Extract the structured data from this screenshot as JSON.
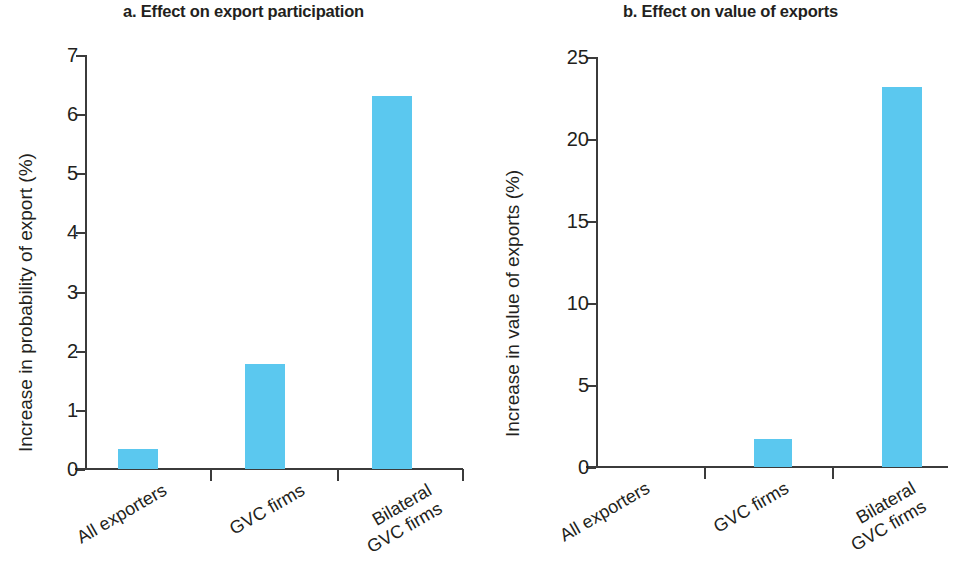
{
  "chart_data": [
    {
      "type": "bar",
      "title": "a. Effect on export participation",
      "xlabel": "",
      "ylabel": "Increase in probability of export (%)",
      "categories": [
        "All exporters",
        "GVC firms",
        "Bilateral\nGVC firms"
      ],
      "values": [
        0.33,
        1.77,
        6.31
      ],
      "ylim": [
        0,
        7
      ],
      "yticks": [
        0,
        1,
        2,
        3,
        4,
        5,
        6,
        7
      ],
      "ytick_labels": [
        "0",
        "1",
        "2",
        "3",
        "4",
        "5",
        "6",
        "7"
      ],
      "grid": false,
      "legend": "none",
      "bar_color": "#5bc8ef"
    },
    {
      "type": "bar",
      "title": "b. Effect on value of exports",
      "xlabel": "",
      "ylabel": "Increase in value of exports (%)",
      "categories": [
        "All exporters",
        "GVC firms",
        "Bilateral\nGVC firms"
      ],
      "values": [
        0,
        1.7,
        23.2
      ],
      "ylim": [
        0,
        25
      ],
      "yticks": [
        0,
        5,
        10,
        15,
        20,
        25
      ],
      "ytick_labels": [
        "0",
        "5",
        "10",
        "15",
        "20",
        "25"
      ],
      "grid": false,
      "legend": "none",
      "bar_color": "#5bc8ef"
    }
  ],
  "panels": {
    "a": {
      "title": "a. Effect on export participation",
      "ylabel": "Increase in probability of export (%)",
      "ytick_labels": [
        "7",
        "6",
        "5",
        "4",
        "3",
        "2",
        "1",
        "0"
      ],
      "cat_labels": [
        "All exporters",
        "GVC firms",
        "Bilateral\nGVC firms"
      ]
    },
    "b": {
      "title": "b. Effect on value of exports",
      "ylabel": "Increase in value of exports (%)",
      "ytick_labels": [
        "25",
        "20",
        "15",
        "10",
        "5",
        "0"
      ],
      "cat_labels": [
        "All exporters",
        "GVC firms",
        "Bilateral\nGVC firms"
      ]
    }
  }
}
